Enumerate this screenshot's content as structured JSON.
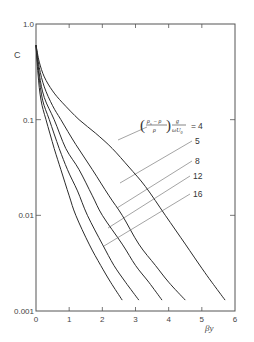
{
  "chart_data": {
    "type": "line",
    "title": "",
    "xlabel": "βy",
    "ylabel": "C",
    "xlim": [
      0,
      6
    ],
    "ylim": [
      0.001,
      1.0
    ],
    "yscale": "log",
    "grid": false,
    "x_ticks": [
      "0",
      "1",
      "2",
      "3",
      "4",
      "5",
      "6"
    ],
    "y_ticks": [
      "1.0",
      "0.1",
      "0.01",
      "0.001"
    ],
    "legend_parameter": "((ρs − ρ)/ρ) · g/(ωU0)",
    "legend_position": "inline leader lines, right",
    "series": [
      {
        "name": "4",
        "x": [
          0,
          0.1,
          0.25,
          0.5,
          0.8,
          1.3,
          1.8,
          2.3,
          2.8,
          3.3,
          3.9,
          4.5,
          5.0,
          5.3,
          5.7
        ],
        "y": [
          0.6,
          0.4,
          0.28,
          0.2,
          0.15,
          0.1,
          0.072,
          0.05,
          0.032,
          0.02,
          0.01,
          0.005,
          0.0028,
          0.002,
          0.0013
        ]
      },
      {
        "name": "5",
        "x": [
          0,
          0.1,
          0.25,
          0.5,
          0.75,
          1.2,
          1.7,
          2.2,
          2.6,
          3.1,
          3.6,
          4.0,
          4.5
        ],
        "y": [
          0.6,
          0.35,
          0.22,
          0.14,
          0.1,
          0.055,
          0.03,
          0.016,
          0.01,
          0.005,
          0.003,
          0.002,
          0.0013
        ]
      },
      {
        "name": "8",
        "x": [
          0,
          0.1,
          0.25,
          0.55,
          0.9,
          1.3,
          1.7,
          2.0,
          2.6,
          3.0,
          3.4,
          3.8
        ],
        "y": [
          0.6,
          0.3,
          0.17,
          0.1,
          0.05,
          0.03,
          0.016,
          0.01,
          0.005,
          0.003,
          0.002,
          0.0013
        ]
      },
      {
        "name": "12",
        "x": [
          0,
          0.08,
          0.2,
          0.4,
          0.7,
          0.95,
          1.25,
          1.55,
          2.0,
          2.35,
          2.7,
          3.1
        ],
        "y": [
          0.6,
          0.3,
          0.16,
          0.1,
          0.05,
          0.03,
          0.018,
          0.01,
          0.005,
          0.003,
          0.002,
          0.0013
        ]
      },
      {
        "name": "16",
        "x": [
          0,
          0.06,
          0.15,
          0.3,
          0.55,
          0.75,
          1.0,
          1.2,
          1.6,
          1.95,
          2.25,
          2.6
        ],
        "y": [
          0.6,
          0.3,
          0.16,
          0.1,
          0.05,
          0.03,
          0.016,
          0.01,
          0.005,
          0.003,
          0.002,
          0.0013
        ]
      }
    ],
    "leader_lines": [
      {
        "label": "4",
        "from": [
          118,
          140
        ],
        "to": [
          147,
          127
        ]
      },
      {
        "label": "5",
        "from": [
          120,
          183
        ],
        "to": [
          192,
          141
        ]
      },
      {
        "label": "8",
        "from": [
          117,
          208
        ],
        "to": [
          192,
          161
        ]
      },
      {
        "label": "12",
        "from": [
          108,
          228
        ],
        "to": [
          190,
          176
        ]
      },
      {
        "label": "16",
        "from": [
          104,
          246
        ],
        "to": [
          190,
          194
        ]
      }
    ]
  },
  "labels": {
    "y_axis": "C",
    "x_axis": "βy",
    "formula_prefix": "=",
    "curve_labels": [
      "4",
      "5",
      "8",
      "12",
      "16"
    ]
  }
}
